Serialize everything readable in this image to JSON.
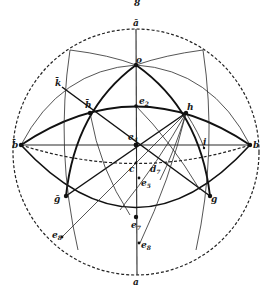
{
  "figure": {
    "caption_mark": "8",
    "labels": {
      "a_bar": "ā",
      "o": "o",
      "e2": "e",
      "e2_sub": "2",
      "e4": "e",
      "e4_sub": "4",
      "c": "c",
      "d7": "d",
      "d7_sub": "7",
      "e5": "e",
      "e5_sub": "5",
      "e7": "e",
      "e7_sub": "7",
      "e8": "e",
      "e8_sub": "8",
      "e8p": "e",
      "e8p_sub": "8",
      "a": "a",
      "b_left": "b̄",
      "b_right": "b",
      "k": "k̄",
      "h_left": "h̄",
      "h_right": "h",
      "i": "i",
      "g_left": "ḡ",
      "g_right": "g"
    }
  }
}
